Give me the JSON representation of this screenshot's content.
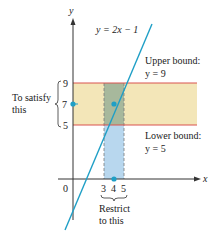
{
  "diagram": {
    "equation_label": "y = 2x − 1",
    "axes": {
      "x_label": "x",
      "y_label": "y",
      "origin_label": "0"
    },
    "y_ticks": [
      "9",
      "7",
      "5"
    ],
    "x_ticks": [
      "3",
      "4",
      "5"
    ],
    "upper_bound": {
      "title": "Upper bound:",
      "value": "y = 9"
    },
    "lower_bound": {
      "title": "Lower bound:",
      "value": "y = 5"
    },
    "left_annotation": {
      "line1": "To satisfy",
      "line2": "this"
    },
    "bottom_annotation": {
      "line1": "Restrict",
      "line2": "to this"
    },
    "colors": {
      "line": "#1f9fc6",
      "bound_line": "#d9534f",
      "y_band": "#f3e6b8",
      "x_band": "#b8d7ee",
      "overlap": "#9fb59a",
      "axis": "#333333",
      "point": "#1f9fc6"
    }
  }
}
